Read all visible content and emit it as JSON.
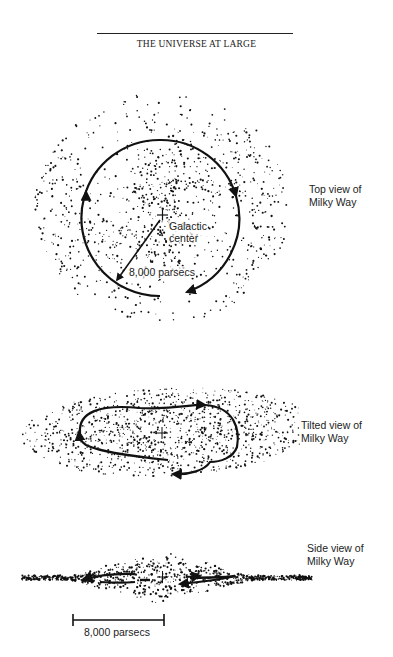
{
  "header": {
    "running_head": "THE UNIVERSE AT LARGE"
  },
  "figures": {
    "top_view": {
      "caption_line1": "Top view of",
      "caption_line2": "Milky Way",
      "center_label_line1": "Galactic",
      "center_label_line2": "center",
      "radius_label": "8,000 parsecs"
    },
    "tilted_view": {
      "caption_line1": "Tilted view of",
      "caption_line2": "Milky Way"
    },
    "side_view": {
      "caption_line1": "Side view of",
      "caption_line2": "Milky Way",
      "scale_bar_label": "8,000 parsecs"
    }
  },
  "colors": {
    "ink": "#111111",
    "background": "#ffffff"
  }
}
